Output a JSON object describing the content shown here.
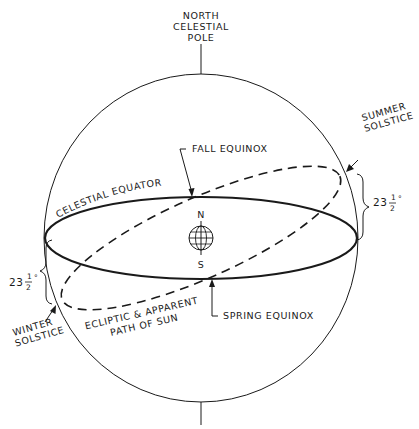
{
  "diagram": {
    "title_pole_top": [
      "NORTH",
      "CELESTIAL",
      "POLE"
    ],
    "labels": {
      "celestial_equator": "CELESTIAL EQUATOR",
      "fall_equinox": "FALL EQUINOX",
      "spring_equinox": "SPRING EQUINOX",
      "summer_solstice": [
        "SUMMER",
        "SOLSTICE"
      ],
      "winter_solstice": [
        "WINTER",
        "SOLSTICE"
      ],
      "ecliptic": [
        "ECLIPTIC & APPARENT",
        "PATH OF SUN"
      ],
      "earth_north": "N",
      "earth_south": "S"
    },
    "angles": {
      "summer_tilt": {
        "whole": "23",
        "num": "1",
        "den": "2",
        "unit": "°"
      },
      "winter_tilt": {
        "whole": "23",
        "num": "1",
        "den": "2",
        "unit": "°"
      }
    },
    "colors": {
      "ink": "#1a1a1a",
      "background": "#ffffff"
    }
  }
}
